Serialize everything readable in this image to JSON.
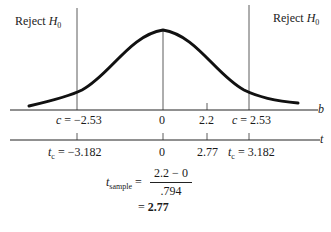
{
  "regions": {
    "left_label": "Reject",
    "right_label": "Reject",
    "hypothesis": "H",
    "hypothesis_sub": "0"
  },
  "b_axis": {
    "name": "b",
    "ticks": [
      {
        "label": "c = −2.53",
        "value": -2.53
      },
      {
        "label": "0",
        "value": 0
      },
      {
        "label": "2.2",
        "value": 2.2
      },
      {
        "label": "c = 2.53",
        "value": 2.53
      }
    ]
  },
  "t_axis": {
    "name": "t",
    "ticks": [
      {
        "label_var": "t",
        "label_sub": "c",
        "label_rest": " = −3.182",
        "value": -3.182
      },
      {
        "label": "0",
        "value": 0
      },
      {
        "label": "2.77",
        "value": 2.77
      },
      {
        "label_var": "t",
        "label_sub": "c",
        "label_rest": " = 3.182",
        "value": 3.182
      }
    ]
  },
  "formula": {
    "var": "t",
    "sub": "sample",
    "eq": "=",
    "numerator": "2.2 − 0",
    "denominator": ".794",
    "result_eq": "=",
    "result": "2.77"
  }
}
